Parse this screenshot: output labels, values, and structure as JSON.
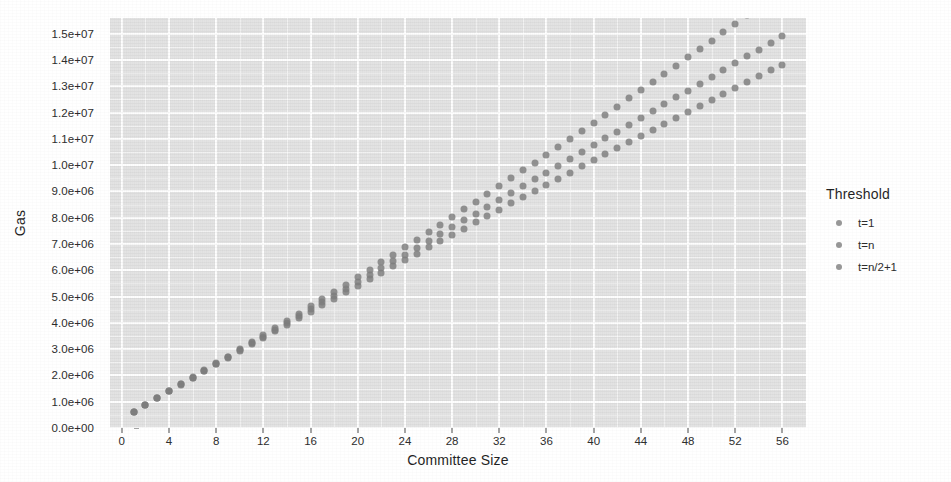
{
  "chart_data": {
    "type": "scatter",
    "title": "",
    "xlabel": "Committee Size",
    "ylabel": "Gas",
    "xlim": [
      -1,
      58
    ],
    "ylim": [
      0,
      15600000
    ],
    "grid": true,
    "legend_position": "right",
    "legend_title": "Threshold",
    "x_ticks": [
      0,
      4,
      8,
      12,
      16,
      20,
      24,
      28,
      32,
      36,
      40,
      44,
      48,
      52,
      56
    ],
    "x_tick_labels": [
      "0",
      "4",
      "8",
      "12",
      "16",
      "20",
      "24",
      "28",
      "32",
      "36",
      "40",
      "44",
      "48",
      "52",
      "56"
    ],
    "x_minor_ticks": [
      2,
      6,
      10,
      14,
      18,
      22,
      26,
      30,
      34,
      38,
      42,
      46,
      50,
      54
    ],
    "y_ticks": [
      0,
      1000000,
      2000000,
      3000000,
      4000000,
      5000000,
      6000000,
      7000000,
      8000000,
      9000000,
      10000000,
      11000000,
      12000000,
      13000000,
      14000000,
      15000000
    ],
    "y_tick_labels": [
      "0.0e+00",
      "1.0e+06",
      "2.0e+06",
      "3.0e+06",
      "4.0e+06",
      "5.0e+06",
      "6.0e+06",
      "7.0e+06",
      "8.0e+06",
      "9.0e+06",
      "1.0e+07",
      "1.1e+07",
      "1.2e+07",
      "1.3e+07",
      "1.4e+07",
      "1.5e+07"
    ],
    "y_minor_ticks": [
      500000,
      1500000,
      2500000,
      3500000,
      4500000,
      5500000,
      6500000,
      7500000,
      8500000,
      9500000,
      10500000,
      11500000,
      12500000,
      13500000,
      14500000
    ],
    "point_color": "#7d7d7d",
    "panel_color": "#e3e3e3",
    "grid_color": "#ffffff",
    "x": [
      1,
      2,
      3,
      4,
      5,
      6,
      7,
      8,
      9,
      10,
      11,
      12,
      13,
      14,
      15,
      16,
      17,
      18,
      19,
      20,
      21,
      22,
      23,
      24,
      25,
      26,
      27,
      28,
      29,
      30,
      31,
      32,
      33,
      34,
      35,
      36,
      37,
      38,
      39,
      40,
      41,
      42,
      43,
      44,
      45,
      46,
      47,
      48,
      49,
      50,
      51,
      52,
      53,
      54,
      55,
      56
    ],
    "series": [
      {
        "name": "t=1",
        "color": "#7d7d7d",
        "values": [
          620000,
          880000,
          1140000,
          1400000,
          1660000,
          1920000,
          2180000,
          2440000,
          2700000,
          2960000,
          3220000,
          3480000,
          3740000,
          4000000,
          4260000,
          4520000,
          4780000,
          5040000,
          5300000,
          5560000,
          5820000,
          6080000,
          6340000,
          6600000,
          6860000,
          7120000,
          7380000,
          7640000,
          7900000,
          8160000,
          8420000,
          8680000,
          8940000,
          9200000,
          9460000,
          9720000,
          9980000,
          10240000,
          10500000,
          10760000,
          11020000,
          11280000,
          11540000,
          11800000,
          12060000,
          12320000,
          12580000,
          12840000,
          13100000,
          13360000,
          13620000,
          13880000,
          14140000,
          14400000,
          14660000,
          14920000
        ]
      },
      {
        "name": "t=n",
        "color": "#7d7d7d",
        "values": [
          620000,
          880000,
          1140000,
          1400000,
          1660000,
          1925000,
          2190000,
          2455000,
          2720000,
          2990000,
          3260000,
          3530000,
          3800000,
          4075000,
          4350000,
          4625000,
          4900000,
          5180000,
          5460000,
          5740000,
          6020000,
          6305000,
          6590000,
          6875000,
          7160000,
          7450000,
          7740000,
          8030000,
          8320000,
          8615000,
          8910000,
          9205000,
          9500000,
          9800000,
          10100000,
          10400000,
          10700000,
          11005000,
          11310000,
          11615000,
          11920000,
          12230000,
          12540000,
          12850000,
          13160000,
          13475000,
          13790000,
          14105000,
          14420000,
          14740000,
          15060000,
          15380000,
          15700000,
          16020000,
          16345000,
          16670000
        ]
      },
      {
        "name": "t=n/2+1",
        "color": "#7d7d7d",
        "values": [
          620000,
          880000,
          1140000,
          1400000,
          1655000,
          1910000,
          2165000,
          2420000,
          2675000,
          2930000,
          3180000,
          3430000,
          3680000,
          3930000,
          4180000,
          4430000,
          4675000,
          4920000,
          5165000,
          5410000,
          5655000,
          5900000,
          6145000,
          6390000,
          6630000,
          6870000,
          7110000,
          7350000,
          7590000,
          7830000,
          8070000,
          8310000,
          8545000,
          8780000,
          9015000,
          9250000,
          9485000,
          9720000,
          9955000,
          10190000,
          10420000,
          10650000,
          10880000,
          11110000,
          11340000,
          11570000,
          11800000,
          12030000,
          12255000,
          12480000,
          12705000,
          12930000,
          13155000,
          13380000,
          13605000,
          13830000
        ]
      }
    ],
    "legend_entries": [
      {
        "label": "t=1",
        "color": "#7d7d7d"
      },
      {
        "label": "t=n",
        "color": "#7d7d7d"
      },
      {
        "label": "t=n/2+1",
        "color": "#7d7d7d"
      }
    ]
  }
}
